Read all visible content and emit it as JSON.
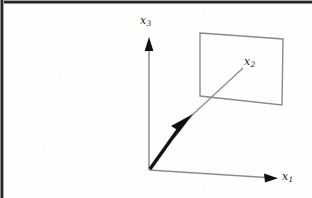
{
  "figure": {
    "kind": "3d-coordinate-axes-diagram",
    "caption_text": "",
    "background_color": "#fdfdfc",
    "ink_color": "#8d8d8d",
    "accent_color": "#101010",
    "axes": [
      {
        "id": "x3",
        "name": "x3-axis",
        "label": "x",
        "subscript": "3",
        "direction": "vertical-up",
        "origin": [
          149,
          170
        ],
        "tip": [
          149,
          38
        ],
        "arrowhead": "solid-triangle"
      },
      {
        "id": "x2",
        "name": "x2-axis",
        "label": "x",
        "subscript": "2",
        "direction": "diagonal-up-right",
        "origin": [
          149,
          170
        ],
        "tip": [
          243,
          68
        ],
        "arrowhead": "solid-triangle-midline",
        "arrowhead_at": [
          190,
          117
        ],
        "emphasis": "thick-vector"
      },
      {
        "id": "x1",
        "name": "x1-axis",
        "label": "x",
        "subscript": "1",
        "direction": "diagonal-down-right",
        "origin": [
          149,
          170
        ],
        "tip": [
          277,
          178
        ],
        "arrowhead": "solid-triangle"
      }
    ],
    "plane": {
      "name": "plane-quadrilateral",
      "corners": [
        [
          200,
          33
        ],
        [
          283,
          39
        ],
        [
          282,
          105
        ],
        [
          200,
          96
        ]
      ],
      "fill": "none",
      "stroke": "#8a8a8a"
    }
  }
}
